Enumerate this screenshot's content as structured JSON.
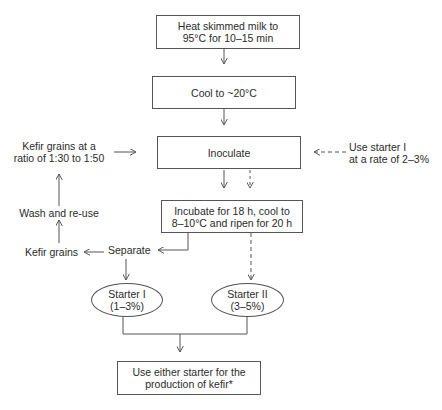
{
  "diagram": {
    "type": "flowchart",
    "nodes": {
      "heat": {
        "lines": [
          "Heat skimmed milk to",
          "95°C for 10–15 min"
        ]
      },
      "cool": {
        "lines": [
          "Cool to ~20°C"
        ]
      },
      "inoculate": {
        "lines": [
          "Inoculate"
        ]
      },
      "incubate": {
        "lines": [
          "Incubate for 18 h, cool to",
          "8–10°C and ripen for 20 h"
        ]
      },
      "separate": {
        "lines": [
          "Separate"
        ]
      },
      "kefir_grains": {
        "lines": [
          "Kefir grains"
        ]
      },
      "wash": {
        "lines": [
          "Wash and re-use"
        ]
      },
      "grains_ratio": {
        "lines": [
          "Kefir grains at a",
          "ratio of 1:30 to 1:50"
        ]
      },
      "use_starter": {
        "lines": [
          "Use starter I",
          "at a rate of 2–3%"
        ]
      },
      "starter1": {
        "lines": [
          "Starter I",
          "(1–3%)"
        ]
      },
      "starter2": {
        "lines": [
          "Starter II",
          "(3–5%)"
        ]
      },
      "final": {
        "lines": [
          "Use either starter for the",
          "production of kefir*"
        ]
      }
    },
    "edges": [
      {
        "from": "heat",
        "to": "cool",
        "style": "solid"
      },
      {
        "from": "cool",
        "to": "inoculate",
        "style": "solid"
      },
      {
        "from": "grains_ratio",
        "to": "inoculate",
        "style": "solid"
      },
      {
        "from": "use_starter",
        "to": "inoculate",
        "style": "dashed"
      },
      {
        "from": "inoculate",
        "to": "incubate",
        "style": "solid"
      },
      {
        "from": "inoculate",
        "to": "incubate",
        "style": "dashed"
      },
      {
        "from": "incubate",
        "to": "separate",
        "style": "solid"
      },
      {
        "from": "incubate",
        "to": "starter2",
        "style": "dashed"
      },
      {
        "from": "separate",
        "to": "kefir_grains",
        "style": "solid"
      },
      {
        "from": "kefir_grains",
        "to": "wash",
        "style": "solid"
      },
      {
        "from": "wash",
        "to": "grains_ratio",
        "style": "solid"
      },
      {
        "from": "separate",
        "to": "starter1",
        "style": "solid"
      },
      {
        "from": "starter1",
        "to": "final",
        "style": "solid"
      },
      {
        "from": "starter2",
        "to": "final",
        "style": "solid"
      }
    ]
  },
  "colors": {
    "line": "#555555",
    "text": "#2b2b2b",
    "background": "#ffffff"
  }
}
